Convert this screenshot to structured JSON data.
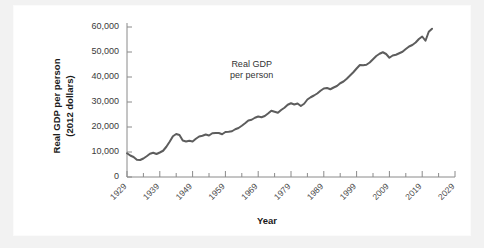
{
  "chart_data": {
    "type": "line",
    "title": "",
    "xlabel": "Year",
    "ylabel": "Real GDP per person (2012 dollars)",
    "ylabel_line1": "Real GDP per person",
    "ylabel_line2": "(2012 dollars)",
    "xlim": [
      1929,
      2029
    ],
    "ylim": [
      0,
      60000
    ],
    "y_ticks": [
      0,
      10000,
      20000,
      30000,
      40000,
      50000,
      60000
    ],
    "y_tick_labels": [
      "0",
      "10,000",
      "20,000",
      "30,000",
      "40,000",
      "50,000",
      "60,000"
    ],
    "x_ticks": [
      1929,
      1939,
      1949,
      1959,
      1969,
      1979,
      1989,
      1999,
      2009,
      2019,
      2029
    ],
    "x_tick_labels": [
      "1929",
      "1939",
      "1949",
      "1959",
      "1969",
      "1979",
      "1989",
      "1999",
      "2009",
      "2019",
      "2029"
    ],
    "x_minor_interval": 5,
    "grid": false,
    "legend": "none",
    "annotations": [
      {
        "text_line1": "Real GDP",
        "text_line2": "per person",
        "x": 1967,
        "y": 44000
      }
    ],
    "series": [
      {
        "name": "Real GDP per person",
        "color": "#5d5d5d",
        "x": [
          1929,
          1930,
          1931,
          1932,
          1933,
          1934,
          1935,
          1936,
          1937,
          1938,
          1939,
          1940,
          1941,
          1942,
          1943,
          1944,
          1945,
          1946,
          1947,
          1948,
          1949,
          1950,
          1951,
          1952,
          1953,
          1954,
          1955,
          1956,
          1957,
          1958,
          1959,
          1960,
          1961,
          1962,
          1963,
          1964,
          1965,
          1966,
          1967,
          1968,
          1969,
          1970,
          1971,
          1972,
          1973,
          1974,
          1975,
          1976,
          1977,
          1978,
          1979,
          1980,
          1981,
          1982,
          1983,
          1984,
          1985,
          1986,
          1987,
          1988,
          1989,
          1990,
          1991,
          1992,
          1993,
          1994,
          1995,
          1996,
          1997,
          1998,
          1999,
          2000,
          2001,
          2002,
          2003,
          2004,
          2005,
          2006,
          2007,
          2008,
          2009,
          2010,
          2011,
          2012,
          2013,
          2014,
          2015,
          2016,
          2017,
          2018,
          2019,
          2020,
          2021,
          2022
        ],
        "values": [
          9500,
          8600,
          8000,
          6900,
          6800,
          7400,
          8300,
          9300,
          9700,
          9200,
          9800,
          10500,
          12100,
          14100,
          16300,
          17200,
          16800,
          14600,
          14200,
          14500,
          14200,
          15300,
          16200,
          16500,
          17000,
          16600,
          17500,
          17600,
          17600,
          17100,
          18000,
          18100,
          18300,
          19100,
          19600,
          20500,
          21500,
          22600,
          22900,
          23700,
          24200,
          23900,
          24400,
          25400,
          26500,
          26100,
          25700,
          26800,
          27700,
          28900,
          29500,
          29000,
          29400,
          28400,
          29300,
          31000,
          31900,
          32600,
          33400,
          34500,
          35400,
          35600,
          35100,
          35800,
          36400,
          37500,
          38200,
          39300,
          40600,
          41900,
          43400,
          44800,
          44700,
          44900,
          45800,
          47100,
          48400,
          49300,
          49900,
          49200,
          47700,
          48600,
          48900,
          49500,
          50100,
          51200,
          52200,
          52800,
          53800,
          55200,
          56200,
          54500,
          58100,
          59300
        ]
      }
    ]
  }
}
